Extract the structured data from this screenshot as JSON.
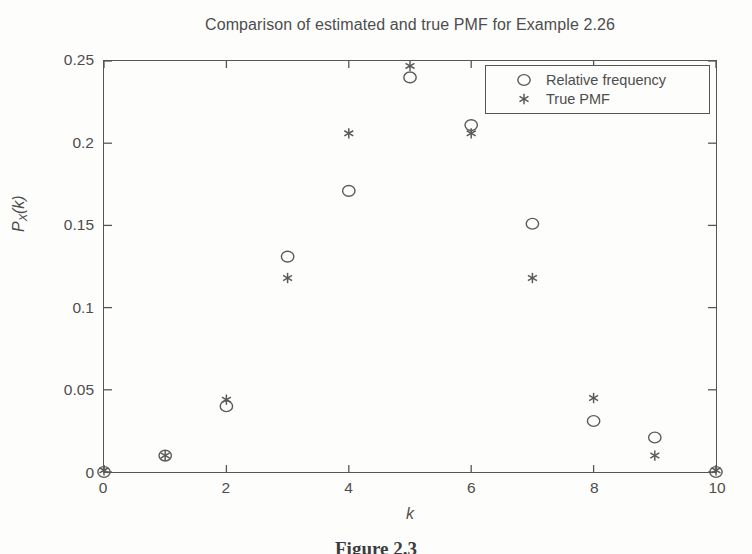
{
  "figure": {
    "title": "Comparison of estimated and true PMF for Example 2.26",
    "caption": "Figure 2.3"
  },
  "axes": {
    "x_label": "k",
    "y_label_base": "P",
    "y_label_sub": "X",
    "y_label_arg": "(k)"
  },
  "legend": {
    "entries": [
      {
        "label": "Relative frequency",
        "marker": "circle-marker"
      },
      {
        "label": "True PMF",
        "marker": "asterisk-marker"
      }
    ]
  },
  "chart_data": {
    "type": "scatter",
    "title": "Comparison of estimated and true PMF for Example 2.26",
    "xlabel": "k",
    "ylabel": "P_X(k)",
    "xlim": [
      0,
      10
    ],
    "ylim": [
      0,
      0.25
    ],
    "grid": false,
    "legend_position": "top-right-inside",
    "xticks": [
      0,
      2,
      4,
      6,
      8,
      10
    ],
    "xtick_labels": [
      "0",
      "2",
      "4",
      "6",
      "8",
      "10"
    ],
    "yticks": [
      0,
      0.05,
      0.1,
      0.15,
      0.2,
      0.25
    ],
    "ytick_labels": [
      "0",
      "0.05",
      "0.1",
      "0.15",
      "0.2",
      "0.25"
    ],
    "x": [
      0,
      1,
      2,
      3,
      4,
      5,
      6,
      7,
      8,
      9,
      10
    ],
    "series": [
      {
        "name": "Relative frequency",
        "marker": "circle",
        "values": [
          0.0,
          0.01,
          0.04,
          0.131,
          0.171,
          0.24,
          0.211,
          0.151,
          0.031,
          0.021,
          0.0
        ]
      },
      {
        "name": "True PMF",
        "marker": "asterisk",
        "values": [
          0.001,
          0.01,
          0.044,
          0.118,
          0.206,
          0.247,
          0.206,
          0.118,
          0.045,
          0.01,
          0.001
        ]
      }
    ]
  },
  "style": {
    "stroke": "#565656",
    "marker_color": "#5a5a5a",
    "text_color": "#4d4d4d",
    "background": "#fdfdfc"
  }
}
